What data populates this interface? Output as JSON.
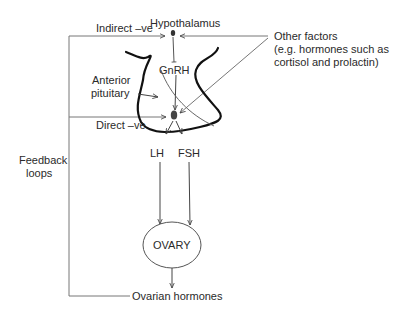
{
  "diagram": {
    "labels": {
      "indirect": "Indirect –ve",
      "hypothalamus": "Hypothalamus",
      "other_factors_line1": "Other factors",
      "other_factors_line2": "(e.g. hormones such as",
      "other_factors_line3": "cortisol and prolactin)",
      "gnrh": "GnRH",
      "anterior_line1": "Anterior",
      "anterior_line2": "pituitary",
      "direct": "Direct –ve",
      "lh": "LH",
      "fsh": "FSH",
      "feedback_line1": "Feedback",
      "feedback_line2": "loops",
      "ovary": "OVARY",
      "ovarian_hormones": "Ovarian hormones"
    },
    "colors": {
      "line": "#555555",
      "outline": "#111111",
      "text": "#2a2a2a"
    }
  }
}
